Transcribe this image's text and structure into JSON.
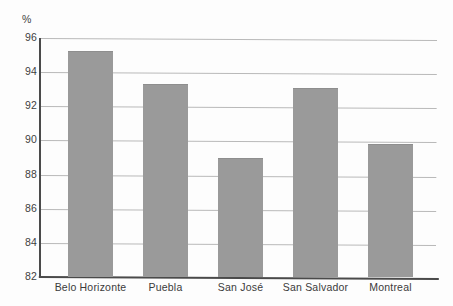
{
  "chart_data": {
    "type": "bar",
    "title": "",
    "subtitle": "",
    "xlabel": "",
    "ylabel": "%",
    "unit_label": "%",
    "categories": [
      "Belo Horizonte",
      "Puebla",
      "San José",
      "San Salvador",
      "Montreal"
    ],
    "values": [
      95.25,
      93.3,
      88.95,
      93.1,
      89.8
    ],
    "ylim": [
      82,
      96
    ],
    "yticks": [
      82,
      84,
      86,
      88,
      90,
      92,
      94,
      96
    ],
    "ytick_labels": [
      "82",
      "84",
      "86",
      "88",
      "90",
      "92",
      "94",
      "96"
    ],
    "grid": true,
    "grid_axis": "y",
    "legend": false,
    "legend_position": "none",
    "series": [
      {
        "name": "",
        "values": [
          95.25,
          93.3,
          88.95,
          93.1,
          89.8
        ]
      }
    ],
    "colors": {
      "bar_fill": "#9a9a9a",
      "bar_edge": "#8e8e8e",
      "gridline": "#b9b9b9",
      "axis": "#4a4a4a",
      "text": "#3c3c3c",
      "background": "#fdfdfd"
    }
  }
}
